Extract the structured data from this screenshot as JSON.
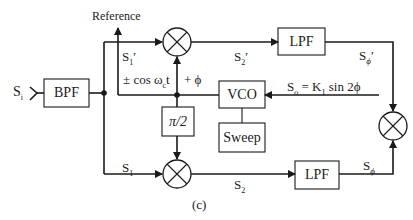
{
  "diagram": {
    "caption": "(c)",
    "input_label": "S",
    "input_sub": "i",
    "reference_label": "Reference",
    "blocks": {
      "bpf": "BPF",
      "lpf_top": "LPF",
      "lpf_bottom": "LPF",
      "vco": "VCO",
      "sweep": "Sweep",
      "phase_shift": "π/2"
    },
    "signals": {
      "s1_prime": "S",
      "s1_prime_sub": "1",
      "s1_prime_mark": "′",
      "s2_prime": "S",
      "s2_prime_sub": "2",
      "s2_prime_mark": "′",
      "s_phi_prime": "S",
      "s_phi_prime_sub": "ϕ",
      "s_phi_prime_mark": "′",
      "s1": "S",
      "s1_sub": "1",
      "s2": "S",
      "s2_sub": "2",
      "s_phi": "S",
      "s_phi_sub": "ϕ",
      "so_eq": "S",
      "so_sub": "o",
      "so_rhs": " = K",
      "so_k_sub": "1",
      "so_tail": " sin 2ϕ",
      "cos_label": "± cos ω",
      "cos_sub": "c",
      "cos_tail": "t",
      "phi_label": "+ ϕ"
    },
    "colors": {
      "stroke": "#1a1a1a",
      "background": "#ffffff"
    }
  }
}
